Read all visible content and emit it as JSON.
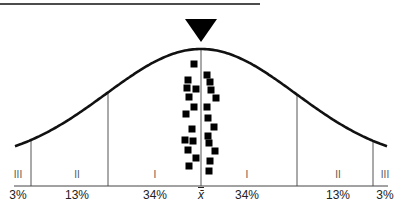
{
  "diagram": {
    "type": "normal-distribution-curve",
    "colors": {
      "curve": "#111111",
      "lines": "#555555",
      "markers": "#000000",
      "text": "#222222"
    },
    "top_rule": {
      "x1": 0,
      "x2": 260,
      "y": 4
    },
    "pointer": {
      "shape": "down-triangle",
      "cx": 201,
      "top": 19,
      "tip": 42,
      "half_width": 16
    },
    "center_label": "x̄",
    "zones": [
      {
        "roman": "III",
        "percent": "3%",
        "x": 18
      },
      {
        "roman": "II",
        "percent": "13%",
        "x": 77
      },
      {
        "roman": "I",
        "percent": "34%",
        "x": 155
      },
      {
        "roman": "I",
        "percent": "34%",
        "x": 247
      },
      {
        "roman": "II",
        "percent": "13%",
        "x": 338
      },
      {
        "roman": "III",
        "percent": "3%",
        "x": 385
      }
    ],
    "dividers_x": [
      31,
      108,
      201,
      297,
      373
    ],
    "markers": [
      [
        194,
        64
      ],
      [
        207,
        75
      ],
      [
        188,
        80
      ],
      [
        210,
        82
      ],
      [
        187,
        88
      ],
      [
        196,
        89
      ],
      [
        211,
        90
      ],
      [
        189,
        97
      ],
      [
        216,
        98
      ],
      [
        194,
        107
      ],
      [
        207,
        107
      ],
      [
        186,
        114
      ],
      [
        208,
        118
      ],
      [
        214,
        127
      ],
      [
        192,
        129
      ],
      [
        208,
        136
      ],
      [
        185,
        140
      ],
      [
        193,
        141
      ],
      [
        209,
        143
      ],
      [
        188,
        150
      ],
      [
        215,
        151
      ],
      [
        196,
        158
      ],
      [
        210,
        161
      ],
      [
        189,
        166
      ],
      [
        209,
        171
      ]
    ]
  }
}
